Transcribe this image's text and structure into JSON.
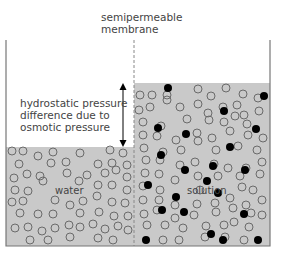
{
  "labels": {
    "membrane": [
      "semipermeable",
      "membrane"
    ],
    "pressure": [
      "hydrostatic pressure",
      "difference due to",
      "osmotic pressure"
    ],
    "water": "water",
    "solution": "solution"
  },
  "colors": {
    "liquid_fill": "#c9c9c9",
    "wall": "#777777",
    "membrane": "#888888",
    "water_molecule_stroke": "#6a6a6a",
    "solute_molecule": "#000000",
    "arrow": "#000000",
    "text": "#444444"
  },
  "geometry": {
    "container": {
      "left": 6,
      "right": 270,
      "top": 40,
      "bottom": 246
    },
    "membrane_x": 134,
    "water_level_y": 147,
    "solution_level_y": 83,
    "arrow": {
      "x": 123,
      "y1": 83,
      "y2": 147
    },
    "molecule_radius": 4
  },
  "molecules": {
    "water_side": [
      [
        12,
        151
      ],
      [
        23,
        151
      ],
      [
        38,
        156
      ],
      [
        53,
        152
      ],
      [
        80,
        153
      ],
      [
        110,
        150
      ],
      [
        123,
        153
      ],
      [
        19,
        164
      ],
      [
        51,
        163
      ],
      [
        66,
        162
      ],
      [
        98,
        164
      ],
      [
        112,
        163
      ],
      [
        127,
        165
      ],
      [
        14,
        178
      ],
      [
        27,
        174
      ],
      [
        40,
        176
      ],
      [
        67,
        173
      ],
      [
        87,
        175
      ],
      [
        105,
        173
      ],
      [
        116,
        170
      ],
      [
        127,
        177
      ],
      [
        15,
        190
      ],
      [
        28,
        191
      ],
      [
        43,
        181
      ],
      [
        79,
        181
      ],
      [
        98,
        185
      ],
      [
        112,
        185
      ],
      [
        127,
        190
      ],
      [
        12,
        202
      ],
      [
        23,
        201
      ],
      [
        55,
        200
      ],
      [
        70,
        205
      ],
      [
        83,
        201
      ],
      [
        97,
        196
      ],
      [
        112,
        202
      ],
      [
        125,
        203
      ],
      [
        20,
        213
      ],
      [
        38,
        214
      ],
      [
        53,
        214
      ],
      [
        80,
        213
      ],
      [
        99,
        212
      ],
      [
        114,
        216
      ],
      [
        128,
        216
      ],
      [
        15,
        228
      ],
      [
        28,
        227
      ],
      [
        42,
        231
      ],
      [
        55,
        228
      ],
      [
        69,
        225
      ],
      [
        80,
        227
      ],
      [
        93,
        224
      ],
      [
        105,
        229
      ],
      [
        118,
        226
      ],
      [
        128,
        230
      ],
      [
        30,
        240
      ],
      [
        48,
        240
      ],
      [
        70,
        237
      ],
      [
        98,
        238
      ],
      [
        113,
        240
      ]
    ],
    "solution_side": [
      [
        140,
        95
      ],
      [
        152,
        95
      ],
      [
        198,
        89
      ],
      [
        226,
        88
      ],
      [
        167,
        95
      ],
      [
        139,
        110
      ],
      [
        167,
        100
      ],
      [
        198,
        104
      ],
      [
        211,
        96
      ],
      [
        243,
        94
      ],
      [
        258,
        98
      ],
      [
        150,
        107
      ],
      [
        180,
        107
      ],
      [
        208,
        113
      ],
      [
        223,
        107
      ],
      [
        237,
        105
      ],
      [
        244,
        115
      ],
      [
        259,
        111
      ],
      [
        143,
        122
      ],
      [
        161,
        126
      ],
      [
        187,
        119
      ],
      [
        209,
        120
      ],
      [
        224,
        122
      ],
      [
        235,
        116
      ],
      [
        247,
        124
      ],
      [
        143,
        135
      ],
      [
        157,
        136
      ],
      [
        176,
        140
      ],
      [
        197,
        133
      ],
      [
        212,
        138
      ],
      [
        230,
        131
      ],
      [
        248,
        135
      ],
      [
        263,
        138
      ],
      [
        144,
        148
      ],
      [
        163,
        152
      ],
      [
        181,
        150
      ],
      [
        198,
        141
      ],
      [
        216,
        150
      ],
      [
        238,
        146
      ],
      [
        257,
        150
      ],
      [
        146,
        160
      ],
      [
        160,
        160
      ],
      [
        180,
        165
      ],
      [
        195,
        162
      ],
      [
        214,
        164
      ],
      [
        228,
        168
      ],
      [
        246,
        168
      ],
      [
        262,
        162
      ],
      [
        145,
        173
      ],
      [
        159,
        174
      ],
      [
        175,
        180
      ],
      [
        198,
        176
      ],
      [
        218,
        176
      ],
      [
        240,
        176
      ],
      [
        260,
        174
      ],
      [
        143,
        186
      ],
      [
        160,
        190
      ],
      [
        200,
        190
      ],
      [
        242,
        187
      ],
      [
        253,
        190
      ],
      [
        143,
        200
      ],
      [
        159,
        200
      ],
      [
        175,
        205
      ],
      [
        197,
        204
      ],
      [
        215,
        203
      ],
      [
        230,
        198
      ],
      [
        246,
        205
      ],
      [
        262,
        200
      ],
      [
        144,
        214
      ],
      [
        157,
        210
      ],
      [
        175,
        218
      ],
      [
        194,
        215
      ],
      [
        216,
        212
      ],
      [
        233,
        208
      ],
      [
        251,
        213
      ],
      [
        262,
        215
      ],
      [
        147,
        225
      ],
      [
        165,
        225
      ],
      [
        183,
        228
      ],
      [
        206,
        226
      ],
      [
        224,
        225
      ],
      [
        234,
        222
      ],
      [
        249,
        227
      ],
      [
        163,
        240
      ],
      [
        179,
        240
      ],
      [
        205,
        237
      ],
      [
        225,
        237
      ],
      [
        244,
        240
      ]
    ],
    "solutes": [
      [
        168,
        88
      ],
      [
        264,
        96
      ],
      [
        158,
        128
      ],
      [
        186,
        134
      ],
      [
        224,
        111
      ],
      [
        256,
        129
      ],
      [
        161,
        155
      ],
      [
        230,
        147
      ],
      [
        185,
        170
      ],
      [
        213,
        166
      ],
      [
        148,
        185
      ],
      [
        162,
        210
      ],
      [
        207,
        181
      ],
      [
        245,
        170
      ],
      [
        184,
        212
      ],
      [
        211,
        234
      ],
      [
        244,
        214
      ],
      [
        146,
        240
      ],
      [
        223,
        240
      ],
      [
        258,
        240
      ],
      [
        176,
        197
      ],
      [
        218,
        193
      ]
    ]
  }
}
